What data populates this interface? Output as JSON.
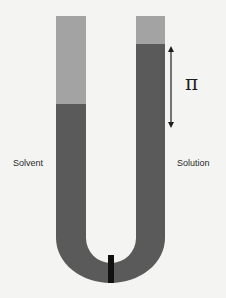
{
  "diagram": {
    "labels": {
      "left": "Solvent",
      "right": "Solution",
      "pressure_symbol": "π"
    },
    "colors": {
      "background": "#f4f4f2",
      "liquid": "#5a5a5a",
      "empty_tube": "#a3a3a3",
      "membrane": "#111111",
      "arrow": "#1e1e1e",
      "text": "#2a2a2a"
    },
    "components": [
      {
        "id": "left-arm",
        "description": "Left arm containing solvent; liquid level lower"
      },
      {
        "id": "right-arm",
        "description": "Right arm containing solution; liquid level higher"
      },
      {
        "id": "membrane",
        "description": "Semipermeable membrane at bottom of U"
      },
      {
        "id": "pressure-arrow",
        "description": "Double-headed arrow showing height difference labelled π"
      }
    ]
  }
}
